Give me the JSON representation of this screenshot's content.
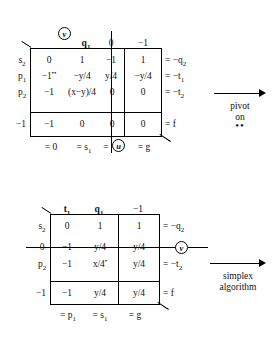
{
  "figure": {
    "ink_color": "#111111"
  },
  "tableau1": {
    "name": "upper-tableau",
    "pivot_marker": "v",
    "column_headers": [
      "",
      "q_1",
      "0",
      "-1"
    ],
    "column_headers_display": [
      "",
      "q₁",
      "0",
      "−1"
    ],
    "row_labels": [
      "s₂",
      "p₁",
      "p₂",
      "−1"
    ],
    "rows": [
      {
        "label": "s₂",
        "cells": [
          "0",
          "1",
          "−1",
          "1"
        ],
        "rhs": "= −q₂"
      },
      {
        "label": "p₁",
        "cells": [
          "−1**",
          "−y/4",
          "y/4",
          "−y/4"
        ],
        "rhs": "= −t₁"
      },
      {
        "label": "p₂",
        "cells": [
          "−1",
          "(x−y)/4",
          "0",
          "0"
        ],
        "rhs": "= −t₂"
      },
      {
        "label": "−1",
        "cells": [
          "−1",
          "0",
          "0",
          "0"
        ],
        "rhs": "= f"
      }
    ],
    "bottom_labels": [
      "= 0",
      "= s₁",
      "=",
      "= g"
    ],
    "bottom_circle": "u",
    "struck_column_index": 2,
    "pivot_cell": {
      "row": 1,
      "col": 0,
      "value": "−1",
      "mark": "**"
    }
  },
  "tableau2": {
    "name": "lower-tableau",
    "pivot_marker": "v",
    "column_headers": [
      "",
      "t_1",
      "q_1",
      "-1"
    ],
    "column_headers_display": [
      "",
      "t₁",
      "q₁",
      "−1"
    ],
    "row_labels": [
      "s₂",
      "0",
      "p₂",
      "−1"
    ],
    "rows": [
      {
        "label": "s₂",
        "cells": [
          "0",
          "1",
          "1"
        ],
        "rhs": "= −q₂"
      },
      {
        "label": "0",
        "cells": [
          "−1",
          "y/4",
          "y/4"
        ],
        "rhs": "",
        "struck": true
      },
      {
        "label": "p₂",
        "cells": [
          "−1",
          "x/4*",
          "y/4"
        ],
        "rhs": "= −t₂"
      },
      {
        "label": "−1",
        "cells": [
          "−1",
          "y/4",
          "y/4"
        ],
        "rhs": "= f"
      }
    ],
    "bottom_labels": [
      "= p₁",
      "= s₁",
      "= g"
    ],
    "struck_row_index": 1,
    "pivot_cell": {
      "row": 2,
      "col": 1,
      "value": "x/4",
      "mark": "*"
    }
  },
  "arrow_top": {
    "label_line1": "pivot",
    "label_line2": "on",
    "label_line3": "••"
  },
  "arrow_bottom": {
    "label_line1": "simplex",
    "label_line2": "algorithm"
  }
}
